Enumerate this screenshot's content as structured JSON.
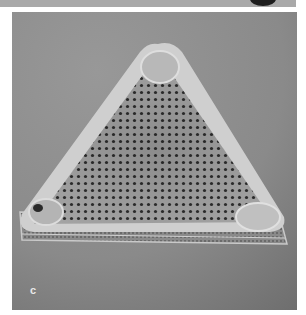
{
  "figure": {
    "panel_label": "c",
    "colors": {
      "background": "#8c8c8c",
      "frustule_rim": "#d8d8d8",
      "valve_face": "#a8a8a8",
      "pores": "#2a2a2a",
      "top_strip": "#a9a9a9"
    }
  }
}
